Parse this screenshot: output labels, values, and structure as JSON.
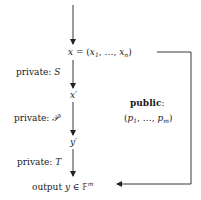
{
  "diagram": {
    "nodes": {
      "input": {
        "lhs": "x",
        "eq": " = (",
        "x1": "x",
        "x1_sub": "1",
        "dots": ", …, ",
        "xn": "x",
        "xn_sub": "n",
        "close": ")"
      },
      "x_prime": {
        "var": "x",
        "prime": "′"
      },
      "y_prime": {
        "var": "y",
        "prime": "′"
      },
      "output": {
        "word": "output ",
        "var": "y",
        "in": " ∈ ",
        "field": "𝔽",
        "exp": "m"
      }
    },
    "steps": [
      {
        "label": "private: ",
        "symbol": "S"
      },
      {
        "label": "private: ",
        "symbol": "𝒫′"
      },
      {
        "label": "private: ",
        "symbol": "T"
      }
    ],
    "public": {
      "title": "public",
      "colon": ":",
      "open": "(",
      "p1": "p",
      "p1_sub": "1",
      "dots": ", …, ",
      "pm": "p",
      "pm_sub": "m",
      "close": ")"
    },
    "colors": {
      "line": "#222222",
      "text": "#1a1a1a",
      "background": "#ffffff"
    }
  }
}
